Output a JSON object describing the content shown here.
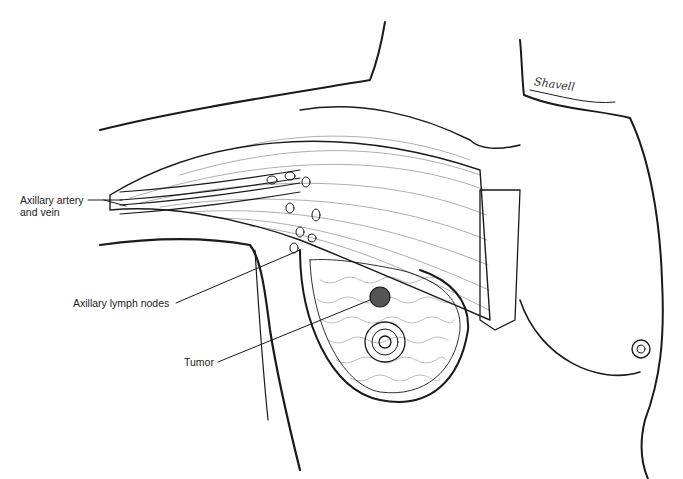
{
  "figure": {
    "labels": {
      "artery_line1": "Axillary artery",
      "artery_line2": "and vein",
      "lymph_nodes": "Axillary lymph nodes",
      "tumor": "Tumor"
    },
    "signature": "Shavell",
    "colors": {
      "ink": "#1a1a1a",
      "background": "#ffffff"
    }
  }
}
